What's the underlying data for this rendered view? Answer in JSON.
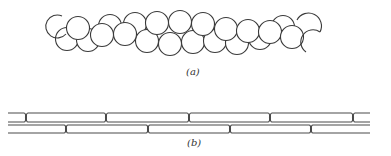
{
  "figure": {
    "panels": [
      {
        "id": "a",
        "label": "(a)",
        "description": "chain of overlapping circles in two staggered rows",
        "stroke_color": "#3a3a3a",
        "circle_radius": 11.5,
        "circles": [
          {
            "cx": 67,
            "cy": 39
          },
          {
            "cx": 88,
            "cy": 40
          },
          {
            "cx": 110,
            "cy": 26
          },
          {
            "cx": 135,
            "cy": 24
          },
          {
            "cx": 147,
            "cy": 41
          },
          {
            "cx": 170,
            "cy": 44
          },
          {
            "cx": 193,
            "cy": 42
          },
          {
            "cx": 215,
            "cy": 41
          },
          {
            "cx": 237,
            "cy": 43
          },
          {
            "cx": 260,
            "cy": 38
          },
          {
            "cx": 283,
            "cy": 27
          },
          {
            "cx": 78,
            "cy": 28
          },
          {
            "cx": 102,
            "cy": 35
          },
          {
            "cx": 125,
            "cy": 34
          },
          {
            "cx": 157,
            "cy": 23
          },
          {
            "cx": 180,
            "cy": 22
          },
          {
            "cx": 203,
            "cy": 24
          },
          {
            "cx": 226,
            "cy": 29
          },
          {
            "cx": 248,
            "cy": 31
          },
          {
            "cx": 270,
            "cy": 32
          },
          {
            "cx": 292,
            "cy": 37
          }
        ]
      },
      {
        "id": "b",
        "label": "(b)",
        "description": "two staggered rows of elongated capsule-shaped segments",
        "stroke_color": "#4a4a4a",
        "upper_row_joints_x": [
          26,
          106,
          189,
          270,
          353
        ],
        "lower_row_joints_x": [
          66,
          148,
          230,
          311
        ],
        "upper_row_y": [
          113,
          122
        ],
        "lower_row_y": [
          125,
          133
        ],
        "x_range": [
          8,
          370
        ]
      }
    ]
  }
}
